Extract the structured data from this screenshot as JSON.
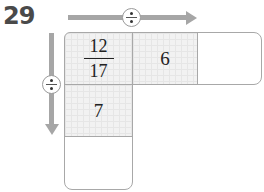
{
  "problem_number": "29",
  "operator": {
    "symbol": "÷",
    "name": "divide"
  },
  "grid": {
    "row0": {
      "cell0": {
        "numerator": "12",
        "denominator": "17"
      },
      "cell1": "6",
      "cell2": ""
    },
    "row1": {
      "cell0": "7"
    },
    "row2": {
      "cell0": ""
    }
  }
}
